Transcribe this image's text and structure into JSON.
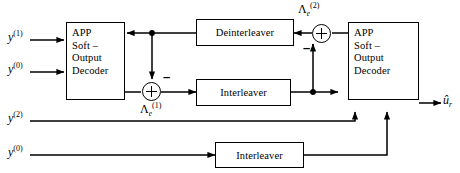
{
  "diagram": {
    "stroke_color": "#000000",
    "background_color": "#ffffff",
    "blocks": [
      {
        "id": "decoder1",
        "label_lines": [
          "APP",
          "Soft –",
          "Output",
          "Decoder"
        ]
      },
      {
        "id": "decoder2",
        "label_lines": [
          "APP",
          "Soft –",
          "Output",
          "Decoder"
        ]
      },
      {
        "id": "deinterleaver",
        "label": "Deinterleaver"
      },
      {
        "id": "interleaver_mid",
        "label": "Interleaver"
      },
      {
        "id": "interleaver_bottom",
        "label": "Interleaver"
      }
    ],
    "inputs": [
      {
        "id": "y1",
        "base": "y",
        "sup": "(1)"
      },
      {
        "id": "y0_top",
        "base": "y",
        "sup": "(0)"
      },
      {
        "id": "y2",
        "base": "y",
        "sup": "(2)"
      },
      {
        "id": "y0_bottom",
        "base": "y",
        "sup": "(0)"
      }
    ],
    "output": {
      "id": "u_hat",
      "base": "û",
      "sub": "r"
    },
    "signals": [
      {
        "id": "lambda_e_1",
        "base": "Λ",
        "sub": "e",
        "sup": "(1)"
      },
      {
        "id": "lambda_e_2",
        "base": "Λ",
        "sub": "e",
        "sup": "(2)"
      }
    ],
    "adders": [
      {
        "id": "adder1",
        "operator": "+",
        "negative_input_sign": "–"
      },
      {
        "id": "adder2",
        "operator": "+",
        "negative_input_sign": "–"
      }
    ]
  }
}
